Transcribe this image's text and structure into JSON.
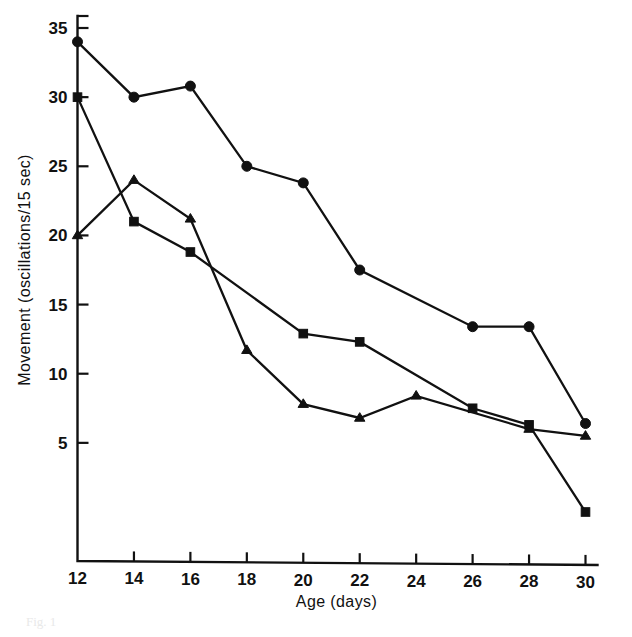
{
  "figure": {
    "background_color": "#ffffff",
    "ink_color": "#111111",
    "partial_caption": "Fig. 1"
  },
  "chart_data": {
    "type": "line",
    "title": "",
    "subtitle": "",
    "xlabel": "Age (days)",
    "ylabel": "Movement (oscillations/15 sec)",
    "xlim": [
      12,
      30
    ],
    "ylim": [
      0,
      35
    ],
    "xticks": [
      12,
      14,
      16,
      18,
      20,
      22,
      24,
      26,
      28,
      30
    ],
    "xtick_labels": [
      "12",
      "14",
      "16",
      "18",
      "20",
      "22",
      "24",
      "26",
      "28",
      "30"
    ],
    "yticks": [
      5,
      10,
      15,
      20,
      25,
      30,
      35
    ],
    "ytick_labels": [
      "5",
      "10",
      "15",
      "20",
      "25",
      "30",
      "35"
    ],
    "grid": false,
    "legend": null,
    "legend_position": "none",
    "series": [
      {
        "name": "filled-circle-series",
        "marker": "circle",
        "x": [
          12,
          14,
          16,
          18,
          20,
          22,
          26,
          28,
          30
        ],
        "values": [
          34.0,
          30.0,
          30.8,
          25.0,
          23.8,
          17.5,
          13.4,
          13.4,
          6.4
        ]
      },
      {
        "name": "filled-square-series",
        "marker": "square",
        "x": [
          12,
          14,
          16,
          20,
          22,
          26,
          28,
          30
        ],
        "values": [
          30.0,
          21.0,
          18.8,
          12.9,
          12.3,
          7.5,
          6.3,
          0.0
        ]
      },
      {
        "name": "filled-triangle-series",
        "marker": "triangle",
        "x": [
          12,
          14,
          16,
          18,
          20,
          22,
          24,
          28,
          30
        ],
        "values": [
          20.0,
          24.0,
          21.2,
          11.7,
          7.8,
          6.8,
          8.4,
          6.0,
          5.5
        ]
      }
    ]
  }
}
